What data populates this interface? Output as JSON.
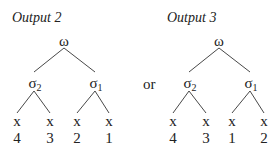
{
  "diagrams": [
    {
      "title": "Output 2",
      "root": "ω",
      "children": [
        {
          "label": "σ",
          "sub": "2",
          "leaves": [
            {
              "var": "x",
              "index": "4"
            },
            {
              "var": "x",
              "index": "3"
            }
          ]
        },
        {
          "label": "σ",
          "sub": "1",
          "leaves": [
            {
              "var": "x",
              "index": "2"
            },
            {
              "var": "x",
              "index": "1"
            }
          ]
        }
      ]
    },
    {
      "title": "Output 3",
      "root": "ω",
      "children": [
        {
          "label": "σ",
          "sub": "2",
          "leaves": [
            {
              "var": "x",
              "index": "4"
            },
            {
              "var": "x",
              "index": "3"
            }
          ]
        },
        {
          "label": "σ",
          "sub": "1",
          "leaves": [
            {
              "var": "x",
              "index": "1"
            },
            {
              "var": "x",
              "index": "2"
            }
          ]
        }
      ]
    }
  ],
  "connector": "or"
}
